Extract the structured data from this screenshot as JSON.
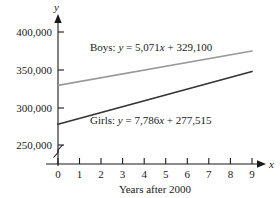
{
  "chart_data": {
    "type": "line",
    "title": "",
    "xlabel": "Years after 2000",
    "ylabel": "y",
    "x_axis_letter": "x",
    "y_axis_letter": "y",
    "x": [
      0,
      1,
      2,
      3,
      4,
      5,
      6,
      7,
      8,
      9
    ],
    "xtick_labels": [
      "0",
      "1",
      "2",
      "3",
      "4",
      "5",
      "6",
      "7",
      "8",
      "9"
    ],
    "ytick_labels": [
      "250,000",
      "300,000",
      "350,000",
      "400,000"
    ],
    "ytick_values": [
      250000,
      300000,
      350000,
      400000
    ],
    "xlim": [
      0,
      9
    ],
    "ylim": [
      250000,
      400000
    ],
    "grid": false,
    "axis_break": true,
    "axis_break_note": "zigzag break on y-axis below 250,000",
    "legend_position": "inline-annotations",
    "series": [
      {
        "name": "Boys",
        "label": "Boys: y = 5,071x + 329,100",
        "label_prefix": "Boys: ",
        "label_y": "y",
        "label_eq_head": " = 5,071",
        "label_x": "x",
        "label_eq_tail": " + 329,100",
        "slope": 5071,
        "intercept": 329100,
        "color": "#9a9a9a",
        "values": [
          329100,
          334171,
          339242,
          344313,
          349384,
          354455,
          359526,
          364597,
          369668,
          374739
        ]
      },
      {
        "name": "Girls",
        "label": "Girls: y = 7,786x + 277,515",
        "label_prefix": "Girls: ",
        "label_y": "y",
        "label_eq_head": " = 7,786",
        "label_x": "x",
        "label_eq_tail": " + 277,515",
        "slope": 7786,
        "intercept": 277515,
        "color": "#333333",
        "values": [
          277515,
          285301,
          293087,
          300873,
          308659,
          316445,
          324231,
          332017,
          339803,
          347589
        ]
      }
    ]
  }
}
